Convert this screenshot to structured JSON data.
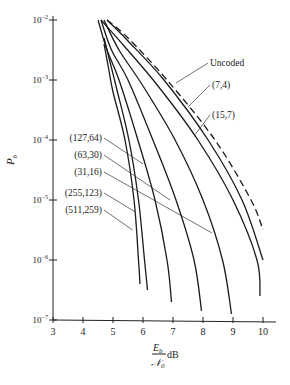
{
  "chart_data": {
    "type": "line",
    "title": "",
    "xlabel_num": "E",
    "xlabel_num_sub": "b",
    "xlabel_den": "𝒩",
    "xlabel_den_sub": "0",
    "xlabel_unit": "dB",
    "ylabel": "P",
    "ylabel_sub": "b",
    "xlim": [
      3,
      10
    ],
    "ylim_log10": [
      -7,
      -2
    ],
    "yscale": "log",
    "x_ticks": [
      "3",
      "4",
      "5",
      "6",
      "7",
      "8",
      "9",
      "10"
    ],
    "y_ticks": [
      {
        "base": "10",
        "exp": "−2",
        "log": -2
      },
      {
        "base": "10",
        "exp": "−3",
        "log": -3
      },
      {
        "base": "10",
        "exp": "−4",
        "log": -4
      },
      {
        "base": "10",
        "exp": "−5",
        "log": -5
      },
      {
        "base": "10",
        "exp": "−6",
        "log": -6
      },
      {
        "base": "10",
        "exp": "−7",
        "log": -7
      }
    ],
    "grid": false,
    "series": [
      {
        "name": "Uncoded",
        "dashed": true,
        "points": [
          [
            4.8,
            -2
          ],
          [
            5.5,
            -2.3
          ],
          [
            6.8,
            -3
          ],
          [
            8.4,
            -4
          ],
          [
            9.6,
            -5
          ],
          [
            10.0,
            -5.5
          ]
        ],
        "label_at": [
          7.1,
          -3.05
        ]
      },
      {
        "name": "(7,4)",
        "dashed": false,
        "points": [
          [
            4.8,
            -2
          ],
          [
            5.5,
            -2.35
          ],
          [
            6.7,
            -3.0
          ],
          [
            8.17,
            -4
          ],
          [
            9.3,
            -5
          ],
          [
            10.0,
            -6.0
          ]
        ],
        "label_at": [
          7.5,
          -3.45
        ]
      },
      {
        "name": "(15,7)",
        "dashed": false,
        "points": [
          [
            4.6,
            -2
          ],
          [
            5.4,
            -2.45
          ],
          [
            6.5,
            -3.1
          ],
          [
            7.83,
            -4
          ],
          [
            9.0,
            -5
          ],
          [
            9.8,
            -6
          ],
          [
            9.9,
            -6.6
          ]
        ],
        "label_at": [
          7.75,
          -3.9
        ]
      },
      {
        "name": "(31,16)",
        "dashed": false,
        "points": [
          [
            4.7,
            -2
          ],
          [
            5.2,
            -2.5
          ],
          [
            6.0,
            -3.1
          ],
          [
            7.07,
            -4
          ],
          [
            8.0,
            -5
          ],
          [
            8.65,
            -6
          ],
          [
            8.95,
            -6.9
          ]
        ],
        "label_at": [
          8.3,
          -5.55
        ]
      },
      {
        "name": "(63,30)",
        "dashed": false,
        "points": [
          [
            4.6,
            -2
          ],
          [
            4.95,
            -2.5
          ],
          [
            5.5,
            -3.0
          ],
          [
            6.33,
            -4
          ],
          [
            7.1,
            -5
          ],
          [
            7.7,
            -6
          ],
          [
            7.95,
            -6.85
          ]
        ],
        "label_at": [
          6.9,
          -5.0
        ]
      },
      {
        "name": "(127,64)",
        "dashed": false,
        "points": [
          [
            4.5,
            -2
          ],
          [
            4.8,
            -2.5
          ],
          [
            5.2,
            -3.0
          ],
          [
            5.83,
            -4
          ],
          [
            6.4,
            -5
          ],
          [
            6.8,
            -6
          ],
          [
            6.95,
            -6.7
          ]
        ],
        "label_at": [
          6.0,
          -4.4
        ]
      },
      {
        "name": "(255,123)",
        "dashed": false,
        "points": [
          [
            4.7,
            -2.3
          ],
          [
            4.9,
            -2.7
          ],
          [
            5.1,
            -3.1
          ],
          [
            5.53,
            -4
          ],
          [
            5.85,
            -5
          ],
          [
            6.05,
            -6
          ],
          [
            6.15,
            -6.5
          ]
        ],
        "label_at": [
          5.75,
          -5.2
        ]
      },
      {
        "name": "(511,259)",
        "dashed": false,
        "points": [
          [
            4.7,
            -2.4
          ],
          [
            4.85,
            -2.8
          ],
          [
            5.0,
            -3.2
          ],
          [
            5.4,
            -4
          ],
          [
            5.7,
            -5
          ],
          [
            5.85,
            -6
          ],
          [
            5.9,
            -6.4
          ]
        ],
        "label_at": [
          5.65,
          -5.5
        ]
      }
    ]
  }
}
